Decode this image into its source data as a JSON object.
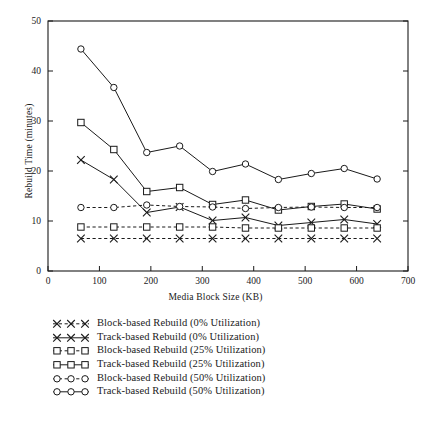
{
  "chart_data": {
    "type": "line",
    "title": "",
    "xlabel": "Media Block Size (KB)",
    "ylabel": "Rebuild Time (minutes)",
    "xlim": [
      0,
      700
    ],
    "ylim": [
      0,
      50
    ],
    "xticks": [
      0,
      100,
      200,
      300,
      400,
      500,
      600,
      700
    ],
    "yticks": [
      0,
      10,
      20,
      30,
      40,
      50
    ],
    "grid": false,
    "legend_position": "below-axes-left",
    "x": [
      64,
      128,
      192,
      256,
      320,
      384,
      448,
      512,
      576,
      640
    ],
    "series": [
      {
        "name": "Block-based Rebuild (0% Utilization)",
        "marker": "x",
        "linestyle": "dashed",
        "values": [
          6.5,
          6.5,
          6.5,
          6.5,
          6.5,
          6.5,
          6.5,
          6.5,
          6.5,
          6.5
        ]
      },
      {
        "name": "Track-based Rebuild (0% Utilization)",
        "marker": "x",
        "linestyle": "solid",
        "values": [
          22.2,
          18.3,
          11.7,
          12.8,
          10.1,
          10.7,
          9.1,
          9.7,
          10.3,
          9.4
        ]
      },
      {
        "name": "Block-based Rebuild (25% Utilization)",
        "marker": "square",
        "linestyle": "dashed",
        "values": [
          8.8,
          8.8,
          8.8,
          8.8,
          8.8,
          8.6,
          8.6,
          8.6,
          8.6,
          8.6
        ]
      },
      {
        "name": "Track-based Rebuild (25% Utilization)",
        "marker": "square",
        "linestyle": "solid",
        "values": [
          29.7,
          24.3,
          15.9,
          16.7,
          13.3,
          14.2,
          12.2,
          12.9,
          13.4,
          12.4
        ]
      },
      {
        "name": "Block-based Rebuild (50% Utilization)",
        "marker": "circle",
        "linestyle": "dashed",
        "values": [
          12.7,
          12.7,
          13.2,
          12.9,
          12.8,
          12.5,
          12.7,
          12.8,
          12.7,
          12.7
        ]
      },
      {
        "name": "Track-based Rebuild (50% Utilization)",
        "marker": "circle",
        "linestyle": "solid",
        "values": [
          44.4,
          36.7,
          23.7,
          25.0,
          19.9,
          21.4,
          18.3,
          19.5,
          20.5,
          18.4
        ]
      }
    ]
  },
  "axes": {
    "xlabel": "Media Block Size (KB)",
    "ylabel": "Rebuild Time (minutes)"
  },
  "legend": {
    "items": [
      {
        "label": "Block-based Rebuild (0% Utilization)",
        "marker": "x",
        "linestyle": "dashed"
      },
      {
        "label": "Track-based Rebuild (0% Utilization)",
        "marker": "x",
        "linestyle": "solid"
      },
      {
        "label": "Block-based Rebuild (25% Utilization)",
        "marker": "square",
        "linestyle": "dashed"
      },
      {
        "label": "Track-based Rebuild (25% Utilization)",
        "marker": "square",
        "linestyle": "solid"
      },
      {
        "label": "Block-based Rebuild (50% Utilization)",
        "marker": "circle",
        "linestyle": "dashed"
      },
      {
        "label": "Track-based Rebuild (50% Utilization)",
        "marker": "circle",
        "linestyle": "solid"
      }
    ]
  },
  "caption": {
    "text": ""
  },
  "colors": {
    "ink": "#1a1a1a",
    "background": "#ffffff"
  }
}
